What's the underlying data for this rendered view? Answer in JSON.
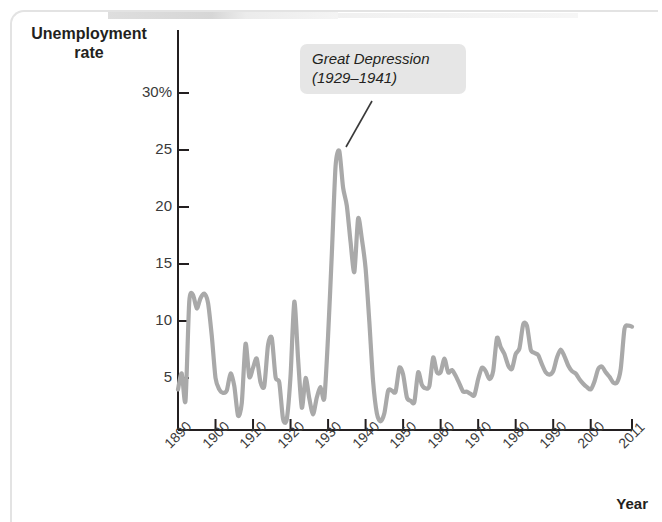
{
  "figure": {
    "y_axis_title": "Unemployment\nrate",
    "x_axis_title": "Year",
    "annotation": "Great Depression\n(1929–1941)",
    "line_color": "#a9a9a9",
    "axis_color": "#231f20",
    "callout_bg": "#e6e6e6"
  },
  "chart_data": {
    "type": "line",
    "title": "",
    "xlabel": "Year",
    "ylabel": "Unemployment rate",
    "xlim": [
      1890,
      2011
    ],
    "ylim": [
      0,
      32
    ],
    "grid": false,
    "legend": null,
    "annotations": [
      {
        "text": "Great Depression (1929–1941)",
        "points_to_year": 1933,
        "points_to_value": 24.9
      }
    ],
    "y_tick_labels": [
      "30%",
      "25",
      "20",
      "15",
      "10",
      "5"
    ],
    "y_ticks": [
      30,
      25,
      20,
      15,
      10,
      5
    ],
    "x_ticks": [
      1890,
      1900,
      1910,
      1920,
      1930,
      1940,
      1950,
      1960,
      1970,
      1980,
      1990,
      2000,
      2011
    ],
    "x_tick_labels": [
      "1890",
      "1900",
      "1910",
      "1920",
      "1930",
      "1940",
      "1950",
      "1960",
      "1970",
      "1980",
      "1990",
      "2000",
      "2011"
    ],
    "series": [
      {
        "name": "Unemployment rate",
        "x": [
          1890,
          1891,
          1892,
          1893,
          1894,
          1895,
          1896,
          1897,
          1898,
          1899,
          1900,
          1901,
          1902,
          1903,
          1904,
          1905,
          1906,
          1907,
          1908,
          1909,
          1910,
          1911,
          1912,
          1913,
          1914,
          1915,
          1916,
          1917,
          1918,
          1919,
          1920,
          1921,
          1922,
          1923,
          1924,
          1925,
          1926,
          1927,
          1928,
          1929,
          1930,
          1931,
          1932,
          1933,
          1934,
          1935,
          1936,
          1937,
          1938,
          1939,
          1940,
          1941,
          1942,
          1943,
          1944,
          1945,
          1946,
          1947,
          1948,
          1949,
          1950,
          1951,
          1952,
          1953,
          1954,
          1955,
          1956,
          1957,
          1958,
          1959,
          1960,
          1961,
          1962,
          1963,
          1964,
          1965,
          1966,
          1967,
          1968,
          1969,
          1970,
          1971,
          1972,
          1973,
          1974,
          1975,
          1976,
          1977,
          1978,
          1979,
          1980,
          1981,
          1982,
          1983,
          1984,
          1985,
          1986,
          1987,
          1988,
          1989,
          1990,
          1991,
          1992,
          1993,
          1994,
          1995,
          1996,
          1997,
          1998,
          1999,
          2000,
          2001,
          2002,
          2003,
          2004,
          2005,
          2006,
          2007,
          2008,
          2009,
          2010,
          2011
        ],
        "values": [
          4.0,
          5.4,
          3.0,
          11.7,
          12.3,
          11.1,
          12.0,
          12.4,
          11.6,
          8.7,
          5.0,
          4.0,
          3.7,
          3.9,
          5.4,
          4.3,
          1.7,
          2.8,
          8.0,
          5.1,
          5.9,
          6.7,
          4.6,
          4.3,
          7.9,
          8.5,
          5.1,
          4.6,
          1.4,
          1.4,
          5.2,
          11.7,
          6.7,
          2.4,
          5.0,
          3.2,
          1.8,
          3.3,
          4.2,
          3.2,
          8.7,
          15.9,
          23.6,
          24.9,
          21.7,
          20.1,
          16.9,
          14.3,
          19.0,
          17.2,
          14.6,
          9.9,
          4.7,
          1.9,
          1.2,
          1.9,
          3.9,
          3.9,
          3.8,
          5.9,
          5.3,
          3.3,
          3.0,
          2.9,
          5.5,
          4.4,
          4.1,
          4.3,
          6.8,
          5.5,
          5.5,
          6.7,
          5.5,
          5.7,
          5.2,
          4.5,
          3.8,
          3.8,
          3.6,
          3.5,
          4.9,
          5.9,
          5.6,
          4.9,
          5.6,
          8.5,
          7.7,
          7.1,
          6.1,
          5.8,
          7.1,
          7.6,
          9.7,
          9.6,
          7.5,
          7.2,
          7.0,
          6.2,
          5.5,
          5.3,
          5.6,
          6.8,
          7.5,
          6.9,
          6.1,
          5.6,
          5.4,
          4.9,
          4.5,
          4.2,
          4.0,
          4.7,
          5.8,
          6.0,
          5.5,
          5.1,
          4.6,
          4.6,
          5.8,
          9.3,
          9.6,
          9.5
        ]
      }
    ]
  }
}
